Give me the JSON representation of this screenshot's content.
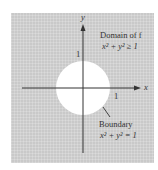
{
  "figure": {
    "axes": {
      "x_label": "x",
      "y_label": "y",
      "x_tick": "1",
      "y_tick": "1"
    },
    "region_label": {
      "title": "Domain of f",
      "inequality": "x² + y² ≥ 1"
    },
    "boundary_label": {
      "title": "Boundary",
      "equation": "x² + y² = 1"
    },
    "colors": {
      "shaded_region": "#c9c9c9",
      "excluded_disk": "#ffffff",
      "axes": "#333333"
    }
  }
}
